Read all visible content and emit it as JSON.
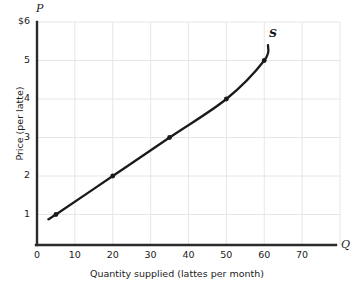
{
  "chart_data": {
    "type": "line",
    "title": "",
    "subtitle": "",
    "xlabel": "Quantity supplied (lattes per month)",
    "ylabel": "Price (per latte)",
    "x_axis_symbol": "Q",
    "y_axis_symbol": "P",
    "xlim": [
      0,
      80
    ],
    "ylim": [
      0,
      6
    ],
    "grid": true,
    "legend_position": "none",
    "xticks": [
      0,
      10,
      20,
      30,
      40,
      50,
      60,
      70
    ],
    "xtick_labels": [
      "0",
      "10",
      "20",
      "30",
      "40",
      "50",
      "60",
      "70"
    ],
    "yticks": [
      1,
      2,
      3,
      4,
      5,
      6
    ],
    "ytick_labels": [
      "1",
      "2",
      "3",
      "4",
      "5",
      "$6"
    ],
    "series": [
      {
        "name": "S",
        "label": "S",
        "color": "#1a1a1a",
        "x": [
          3,
          5,
          20,
          35,
          50,
          60,
          61
        ],
        "y": [
          0.88,
          1,
          2,
          3,
          4,
          5,
          5.4
        ],
        "markers": [
          {
            "x": 5,
            "y": 1
          },
          {
            "x": 20,
            "y": 2
          },
          {
            "x": 35,
            "y": 3
          },
          {
            "x": 50,
            "y": 4
          },
          {
            "x": 60,
            "y": 5
          }
        ]
      }
    ],
    "annotations": [
      {
        "text": "S",
        "x": 62,
        "y": 5.65,
        "style": "bold-italic"
      }
    ]
  },
  "colors": {
    "background": "#ffffff",
    "grid": "#e6e6e6",
    "axis": "#2a2a2a",
    "curve": "#1a1a1a",
    "text": "#1b1b1b"
  }
}
